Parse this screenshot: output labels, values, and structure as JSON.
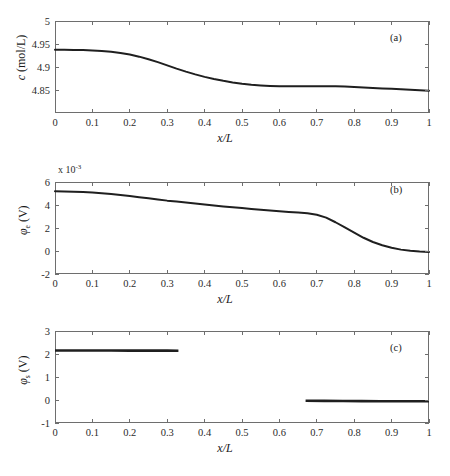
{
  "figure": {
    "background": "#ffffff",
    "line_color": "#1f1f1f",
    "axis_color": "#6e6e6e"
  },
  "chart_data": [
    {
      "type": "line",
      "panel": "(a)",
      "title": "",
      "xlabel": "x/L",
      "ylabel": "c (mol/L)",
      "ylabel_symbol": "c",
      "ylabel_sub": "",
      "ylabel_unit": "(mol/L)",
      "xlim": [
        0,
        1
      ],
      "ylim": [
        4.8,
        5.0
      ],
      "xticks": [
        0,
        0.1,
        0.2,
        0.3,
        0.4,
        0.5,
        0.6,
        0.7,
        0.8,
        0.9,
        1
      ],
      "xticklabels": [
        "0",
        "0.1",
        "0.2",
        "0.3",
        "0.4",
        "0.5",
        "0.6",
        "0.7",
        "0.8",
        "0.9",
        "1"
      ],
      "yticks": [
        4.85,
        4.9,
        4.95,
        5
      ],
      "yticklabels": [
        "4.85",
        "4.9",
        "4.95",
        "5"
      ],
      "exponent": "",
      "grid": false,
      "legend": "none",
      "x": [
        0,
        0.025,
        0.05,
        0.075,
        0.1,
        0.125,
        0.15,
        0.175,
        0.2,
        0.225,
        0.25,
        0.275,
        0.3,
        0.325,
        0.35,
        0.375,
        0.4,
        0.425,
        0.45,
        0.475,
        0.5,
        0.525,
        0.55,
        0.575,
        0.6,
        0.625,
        0.65,
        0.675,
        0.7,
        0.725,
        0.75,
        0.775,
        0.8,
        0.825,
        0.85,
        0.875,
        0.9,
        0.925,
        0.95,
        0.975,
        1
      ],
      "y": [
        4.9375,
        4.9375,
        4.9372,
        4.9368,
        4.936,
        4.9348,
        4.933,
        4.9305,
        4.927,
        4.9225,
        4.917,
        4.9105,
        4.9035,
        4.8965,
        4.89,
        4.884,
        4.8785,
        4.874,
        4.87,
        4.8665,
        4.8635,
        4.8612,
        4.8598,
        4.8588,
        4.8582,
        4.858,
        4.858,
        4.858,
        4.8582,
        4.8582,
        4.858,
        4.8575,
        4.8565,
        4.8555,
        4.8545,
        4.8535,
        4.8525,
        4.8515,
        4.8505,
        4.8495,
        4.8485
      ]
    },
    {
      "type": "line",
      "panel": "(b)",
      "title": "",
      "xlabel": "x/L",
      "ylabel": "φe (V)",
      "ylabel_symbol": "φ",
      "ylabel_sub": "e",
      "ylabel_unit": "(V)",
      "xlim": [
        0,
        1
      ],
      "ylim": [
        -2,
        6
      ],
      "xticks": [
        0,
        0.1,
        0.2,
        0.3,
        0.4,
        0.5,
        0.6,
        0.7,
        0.8,
        0.9,
        1
      ],
      "xticklabels": [
        "0",
        "0.1",
        "0.2",
        "0.3",
        "0.4",
        "0.5",
        "0.6",
        "0.7",
        "0.8",
        "0.9",
        "1"
      ],
      "yticks": [
        -2,
        0,
        2,
        4,
        6
      ],
      "yticklabels": [
        "-2",
        "0",
        "2",
        "4",
        "6"
      ],
      "exponent": "x 10",
      "exponent_power": "-3",
      "grid": false,
      "legend": "none",
      "x": [
        0,
        0.025,
        0.05,
        0.075,
        0.1,
        0.125,
        0.15,
        0.175,
        0.2,
        0.225,
        0.25,
        0.275,
        0.3,
        0.325,
        0.35,
        0.375,
        0.4,
        0.425,
        0.45,
        0.475,
        0.5,
        0.525,
        0.55,
        0.575,
        0.6,
        0.625,
        0.65,
        0.675,
        0.7,
        0.725,
        0.75,
        0.775,
        0.8,
        0.825,
        0.85,
        0.875,
        0.9,
        0.925,
        0.95,
        0.975,
        1
      ],
      "y": [
        5.2,
        5.18,
        5.15,
        5.12,
        5.08,
        5.02,
        4.95,
        4.87,
        4.78,
        4.68,
        4.58,
        4.48,
        4.38,
        4.3,
        4.22,
        4.13,
        4.04,
        3.95,
        3.87,
        3.8,
        3.73,
        3.65,
        3.58,
        3.52,
        3.46,
        3.4,
        3.35,
        3.28,
        3.15,
        2.9,
        2.5,
        2.05,
        1.6,
        1.15,
        0.78,
        0.5,
        0.28,
        0.12,
        0.02,
        -0.04,
        -0.08
      ]
    },
    {
      "type": "line",
      "panel": "(c)",
      "title": "",
      "xlabel": "x/L",
      "ylabel": "φs (V)",
      "ylabel_symbol": "φ",
      "ylabel_sub": "s",
      "ylabel_unit": "(V)",
      "xlim": [
        0,
        1
      ],
      "ylim": [
        -1,
        3
      ],
      "xticks": [
        0,
        0.1,
        0.2,
        0.3,
        0.4,
        0.5,
        0.6,
        0.7,
        0.8,
        0.9,
        1
      ],
      "xticklabels": [
        "0",
        "0.1",
        "0.2",
        "0.3",
        "0.4",
        "0.5",
        "0.6",
        "0.7",
        "0.8",
        "0.9",
        "1"
      ],
      "yticks": [
        -1,
        0,
        1,
        2,
        3
      ],
      "yticklabels": [
        "-1",
        "0",
        "1",
        "2",
        "3"
      ],
      "exponent": "",
      "grid": false,
      "legend": "none",
      "segments": [
        {
          "name": "negative-electrode",
          "x": [
            0,
            0.05,
            0.1,
            0.15,
            0.2,
            0.25,
            0.3,
            0.33
          ],
          "y": [
            2.15,
            2.15,
            2.15,
            2.15,
            2.148,
            2.146,
            2.145,
            2.144
          ]
        },
        {
          "name": "positive-electrode",
          "x": [
            0.67,
            0.72,
            0.77,
            0.82,
            0.87,
            0.92,
            0.97,
            1
          ],
          "y": [
            -0.03,
            -0.04,
            -0.045,
            -0.05,
            -0.052,
            -0.054,
            -0.055,
            -0.056
          ]
        }
      ]
    }
  ]
}
